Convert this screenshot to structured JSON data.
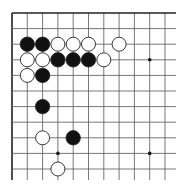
{
  "diagram": {
    "type": "go-board-corner",
    "board_size": 19,
    "visible_region": {
      "columns": 11,
      "rows": 11,
      "corner": "top-left",
      "open_edges": [
        "right",
        "bottom"
      ]
    },
    "colors": {
      "background": "#ffffff",
      "line": "#555555",
      "edge": "#222222",
      "black_stone": "#111111",
      "white_stone": "#ffffff",
      "stone_outline": "#222222"
    },
    "star_points": [
      [
        9,
        3
      ],
      [
        3,
        9
      ],
      [
        9,
        9
      ]
    ],
    "stones": {
      "black": [
        [
          1,
          2
        ],
        [
          2,
          2
        ],
        [
          3,
          3
        ],
        [
          4,
          3
        ],
        [
          5,
          3
        ],
        [
          2,
          4
        ],
        [
          2,
          6
        ],
        [
          4,
          8
        ]
      ],
      "white": [
        [
          3,
          2
        ],
        [
          4,
          2
        ],
        [
          5,
          2
        ],
        [
          7,
          2
        ],
        [
          1,
          3
        ],
        [
          2,
          3
        ],
        [
          6,
          3
        ],
        [
          1,
          4
        ],
        [
          2,
          8
        ],
        [
          3,
          10
        ]
      ]
    }
  }
}
